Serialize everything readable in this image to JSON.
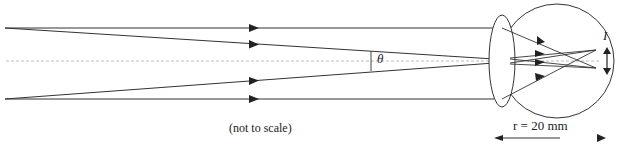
{
  "diagram": {
    "labels": {
      "note": "(not to scale)",
      "angle": "θ",
      "image": "I",
      "radius": "r = 20 mm"
    },
    "components": [
      {
        "name": "parallel-rays-top",
        "description": "Two rays from top of distant object"
      },
      {
        "name": "parallel-rays-bottom",
        "description": "Two rays from bottom of distant object"
      },
      {
        "name": "optical-axis",
        "description": "Dashed horizontal principal axis"
      },
      {
        "name": "eye-lens",
        "description": "Converging lens (ellipse)"
      },
      {
        "name": "eyeball",
        "description": "Circle representing the eye"
      },
      {
        "name": "retinal-image",
        "description": "Double-headed arrow showing image size I"
      },
      {
        "name": "radius-arrow",
        "description": "Arrow indicating eye radius r = 20 mm"
      }
    ],
    "colors": {
      "line": "#333333",
      "axis": "#999999",
      "background": "#ffffff"
    }
  }
}
